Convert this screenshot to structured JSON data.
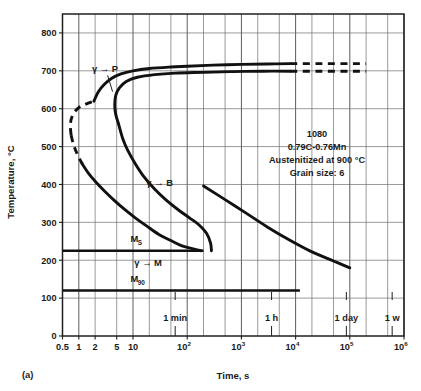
{
  "figure": {
    "panel_label": "(a)",
    "xlabel": "Time, s",
    "ylabel": "Temperature, °C"
  },
  "annotation": {
    "line1": "1080",
    "line2": "0.79C-0.76Mn",
    "line3": "Austenitized at 900 °C",
    "line4": "Grain size: 6"
  },
  "labels": {
    "gamma_to_p": "γ → P",
    "gamma_to_b": "γ → B",
    "gamma_to_m": "γ → M",
    "ms_base": "M",
    "ms_sub": "S",
    "m90_base": "M",
    "m90_sub": "90"
  },
  "time_markers": [
    {
      "label": "1 min",
      "x_value": 60
    },
    {
      "label": "1 h",
      "x_value": 3600
    },
    {
      "label": "1 day",
      "x_value": 86400
    },
    {
      "label": "1 w",
      "x_value": 604800
    }
  ],
  "chart_data": {
    "type": "line",
    "xlabel": "Time, s",
    "ylabel": "Temperature, °C",
    "xscale": "log",
    "xlim": [
      0.5,
      1000000
    ],
    "ylim": [
      0,
      850
    ],
    "grid": true,
    "legend_position": "none",
    "xticks": [
      0.5,
      1,
      2,
      5,
      10,
      100,
      1000,
      10000,
      100000,
      1000000
    ],
    "xtick_labels": [
      "0.5",
      "1",
      "2",
      "5",
      "10",
      "10²",
      "10³",
      "10⁴",
      "10⁵",
      "10⁶"
    ],
    "yticks": [
      0,
      100,
      200,
      300,
      400,
      500,
      600,
      700,
      800
    ],
    "ytick_labels": [
      "0",
      "100",
      "200",
      "300",
      "400",
      "500",
      "600",
      "700",
      "800"
    ],
    "annotations": [
      {
        "text": "γ → P",
        "x_value": 3.0,
        "y_value": 700
      },
      {
        "text": "γ → B",
        "x_value": 30,
        "y_value": 400
      },
      {
        "text": "γ → M",
        "x_value": 18,
        "y_value": 190
      },
      {
        "text": "M_S",
        "x_value": 11,
        "y_value": 253
      },
      {
        "text": "M_90",
        "x_value": 11,
        "y_value": 148
      }
    ],
    "horizontal_lines": [
      {
        "name": "Ms",
        "y_value": 225,
        "x_from": 0.5,
        "x_to": 200,
        "style": "solid"
      },
      {
        "name": "M90",
        "y_value": 120,
        "x_from": 0.5,
        "x_to": 12000,
        "style": "solid"
      }
    ],
    "series": [
      {
        "name": "transformation start (1% pearlite/bainite)",
        "style": "solid",
        "points": [
          [
            1.9,
            620
          ],
          [
            2.3,
            645
          ],
          [
            3.0,
            665
          ],
          [
            4.0,
            680
          ],
          [
            6.0,
            692
          ],
          [
            10,
            700
          ],
          [
            20,
            706
          ],
          [
            50,
            710
          ],
          [
            100,
            712
          ],
          [
            300,
            715
          ],
          [
            1000,
            717
          ],
          [
            3000,
            718
          ],
          [
            8000,
            719
          ]
        ]
      },
      {
        "name": "transformation start (dashed extrapolation, low time)",
        "style": "dashed",
        "points": [
          [
            0.72,
            530
          ],
          [
            0.7,
            560
          ],
          [
            0.78,
            585
          ],
          [
            1.0,
            603
          ],
          [
            1.35,
            612
          ],
          [
            1.9,
            620
          ]
        ]
      },
      {
        "name": "transformation start upper plateau (dashed extension)",
        "style": "dashed",
        "points": [
          [
            8000,
            719
          ],
          [
            30000,
            719
          ],
          [
            100000,
            719
          ],
          [
            200000,
            719
          ]
        ]
      },
      {
        "name": "transformation finish (pearlite nose)",
        "style": "solid",
        "points": [
          [
            5.4,
            560
          ],
          [
            4.8,
            585
          ],
          [
            4.6,
            610
          ],
          [
            4.8,
            635
          ],
          [
            5.6,
            655
          ],
          [
            7.5,
            672
          ],
          [
            12,
            683
          ],
          [
            25,
            690
          ],
          [
            60,
            694
          ],
          [
            200,
            696
          ],
          [
            700,
            698
          ],
          [
            2500,
            699
          ],
          [
            8000,
            699
          ]
        ]
      },
      {
        "name": "transformation finish upper plateau (dashed extension)",
        "style": "dashed",
        "points": [
          [
            8000,
            699
          ],
          [
            30000,
            699
          ],
          [
            100000,
            699
          ],
          [
            200000,
            699
          ]
        ]
      },
      {
        "name": "transformation finish (bainite branch, downward)",
        "style": "solid",
        "points": [
          [
            5.4,
            560
          ],
          [
            6.5,
            520
          ],
          [
            8.0,
            490
          ],
          [
            11,
            455
          ],
          [
            16,
            420
          ],
          [
            25,
            388
          ],
          [
            40,
            360
          ],
          [
            70,
            332
          ],
          [
            110,
            312
          ],
          [
            160,
            295
          ],
          [
            230,
            270
          ],
          [
            270,
            245
          ],
          [
            280,
            225
          ]
        ]
      },
      {
        "name": "transformation finish (long-time descending branch)",
        "style": "solid",
        "points": [
          [
            200,
            396
          ],
          [
            500,
            360
          ],
          [
            1200,
            325
          ],
          [
            3000,
            288
          ],
          [
            8000,
            252
          ],
          [
            20000,
            222
          ],
          [
            50000,
            198
          ],
          [
            100000,
            180
          ]
        ]
      },
      {
        "name": "transformation start (dashed low-temperature extrapolation)",
        "style": "dashed",
        "points": [
          [
            0.72,
            530
          ],
          [
            0.8,
            505
          ],
          [
            0.95,
            478
          ],
          [
            1.15,
            455
          ]
        ]
      },
      {
        "name": "transformation start (bainite start descending)",
        "style": "solid",
        "points": [
          [
            1.15,
            455
          ],
          [
            1.5,
            430
          ],
          [
            2.1,
            405
          ],
          [
            3.0,
            382
          ],
          [
            4.5,
            358
          ],
          [
            7.0,
            334
          ],
          [
            11,
            312
          ],
          [
            18,
            290
          ],
          [
            30,
            268
          ],
          [
            50,
            252
          ],
          [
            80,
            238
          ],
          [
            130,
            230
          ],
          [
            180,
            225
          ]
        ]
      }
    ]
  }
}
